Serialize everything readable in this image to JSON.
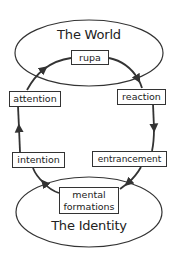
{
  "diagram": {
    "type": "cycle",
    "colors": {
      "stroke": "#333333",
      "background": "#ffffff",
      "text": "#222222"
    },
    "world": {
      "title": "The World"
    },
    "identity": {
      "title": "The Identity"
    },
    "nodes": {
      "rupa": "rupa",
      "reaction": "reaction",
      "entrancement": "entrancement",
      "mental_formations_line1": "mental",
      "mental_formations_line2": "formations",
      "intention": "intention",
      "attention": "attention"
    },
    "cycle_order": [
      "rupa",
      "reaction",
      "entrancement",
      "mental formations",
      "intention",
      "attention"
    ]
  }
}
